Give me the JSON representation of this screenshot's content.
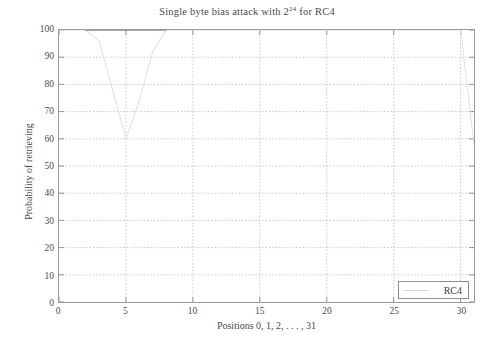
{
  "chart_data": {
    "type": "line",
    "title_prefix": "Single byte bias attack with 2",
    "title_exponent": "24",
    "title_suffix": " for RC4",
    "xlabel": "Positions 0, 1, 2, . . . , 31",
    "ylabel": "Probability of retrieving",
    "xlim": [
      0,
      31
    ],
    "ylim": [
      0,
      100
    ],
    "xticks": [
      0,
      5,
      10,
      15,
      20,
      25,
      30
    ],
    "xtick_labels": [
      "0",
      "5",
      "10",
      "15",
      "20",
      "25",
      "30"
    ],
    "yticks": [
      0,
      10,
      20,
      30,
      40,
      50,
      60,
      70,
      80,
      90,
      100
    ],
    "ytick_labels": [
      "0",
      "10",
      "20",
      "30",
      "40",
      "50",
      "60",
      "70",
      "80",
      "90",
      "100"
    ],
    "grid": true,
    "grid_style": "dotted",
    "grid_color": "#bdbdbd",
    "legend_position": "bottom-right",
    "series": [
      {
        "name": "RC4",
        "color": "#e2e2e2",
        "x": [
          0,
          1,
          2,
          3,
          4,
          5,
          6,
          7,
          8,
          9,
          10,
          11,
          12,
          13,
          14,
          15,
          16,
          17,
          18,
          19,
          20,
          21,
          22,
          23,
          24,
          25,
          26,
          27,
          28,
          29,
          30,
          31
        ],
        "values": [
          100,
          100,
          100,
          96,
          78,
          60,
          74,
          92,
          100,
          100,
          100,
          100,
          100,
          100,
          100,
          100,
          100,
          100,
          100,
          100,
          100,
          100,
          100,
          100,
          100,
          100,
          100,
          100,
          100,
          100,
          100,
          58
        ]
      },
      {
        "name": "RC4-highlight",
        "color": "#8a8a8a",
        "x": [
          2,
          3,
          4,
          5,
          6,
          7,
          8
        ],
        "values": [
          100,
          100,
          100,
          100,
          100,
          100,
          100
        ]
      }
    ]
  },
  "legend": {
    "entries": [
      {
        "label": "RC4",
        "color": "#e2e2e2"
      }
    ]
  }
}
